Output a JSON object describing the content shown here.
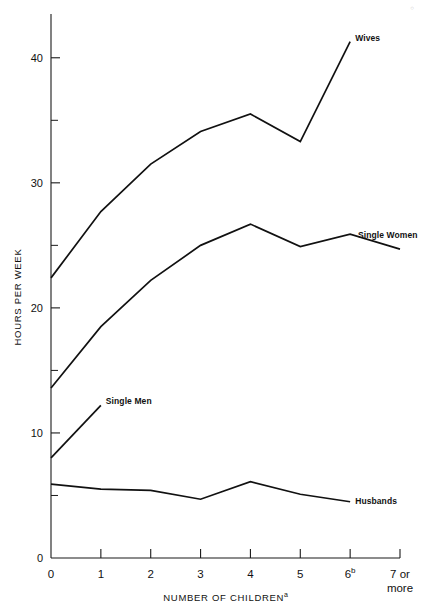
{
  "figure": {
    "corner_mark": "○"
  },
  "chart_data": {
    "type": "line",
    "title": "",
    "xlabel": "NUMBER OF CHILDREN",
    "xlabel_superscript": "a",
    "ylabel": "HOURS PER WEEK",
    "x": [
      0,
      1,
      2,
      3,
      4,
      5,
      6,
      7
    ],
    "categories": [
      "0",
      "1",
      "2",
      "3",
      "4",
      "5",
      "6",
      "7 or more"
    ],
    "xtick_labels": [
      "0",
      "1",
      "2",
      "3",
      "4",
      "5",
      "6",
      "7 or"
    ],
    "xtick_superscripts": [
      "",
      "",
      "",
      "",
      "",
      "",
      "b",
      ""
    ],
    "xtick_second_line": [
      "",
      "",
      "",
      "",
      "",
      "",
      "",
      "more"
    ],
    "ylim": [
      0,
      43.5
    ],
    "xlim": [
      0,
      7
    ],
    "ytick_major": [
      0,
      10,
      20,
      30,
      40
    ],
    "ytick_major_labels": [
      "0",
      "10",
      "20",
      "30",
      "40"
    ],
    "ytick_minor": [
      5,
      15,
      25,
      35
    ],
    "grid": false,
    "legend_position": "inline-end-of-line",
    "series": [
      {
        "name": "Wives",
        "label": "Wives",
        "x": [
          0,
          1,
          2,
          3,
          4,
          5,
          6
        ],
        "values": [
          22.4,
          27.7,
          31.5,
          34.1,
          35.5,
          33.3,
          41.3
        ]
      },
      {
        "name": "Single Women",
        "label": "Single Women",
        "x": [
          0,
          1,
          2,
          3,
          4,
          5,
          6,
          7
        ],
        "values": [
          13.6,
          18.5,
          22.2,
          25.0,
          26.7,
          24.9,
          25.9,
          24.7
        ]
      },
      {
        "name": "Single Men",
        "label": "Single Men",
        "x": [
          0,
          1
        ],
        "values": [
          8.0,
          12.2
        ]
      },
      {
        "name": "Husbands",
        "label": "Husbands",
        "x": [
          0,
          1,
          2,
          3,
          4,
          5,
          6
        ],
        "values": [
          5.9,
          5.5,
          5.4,
          4.7,
          6.1,
          5.1,
          4.5
        ]
      }
    ]
  }
}
